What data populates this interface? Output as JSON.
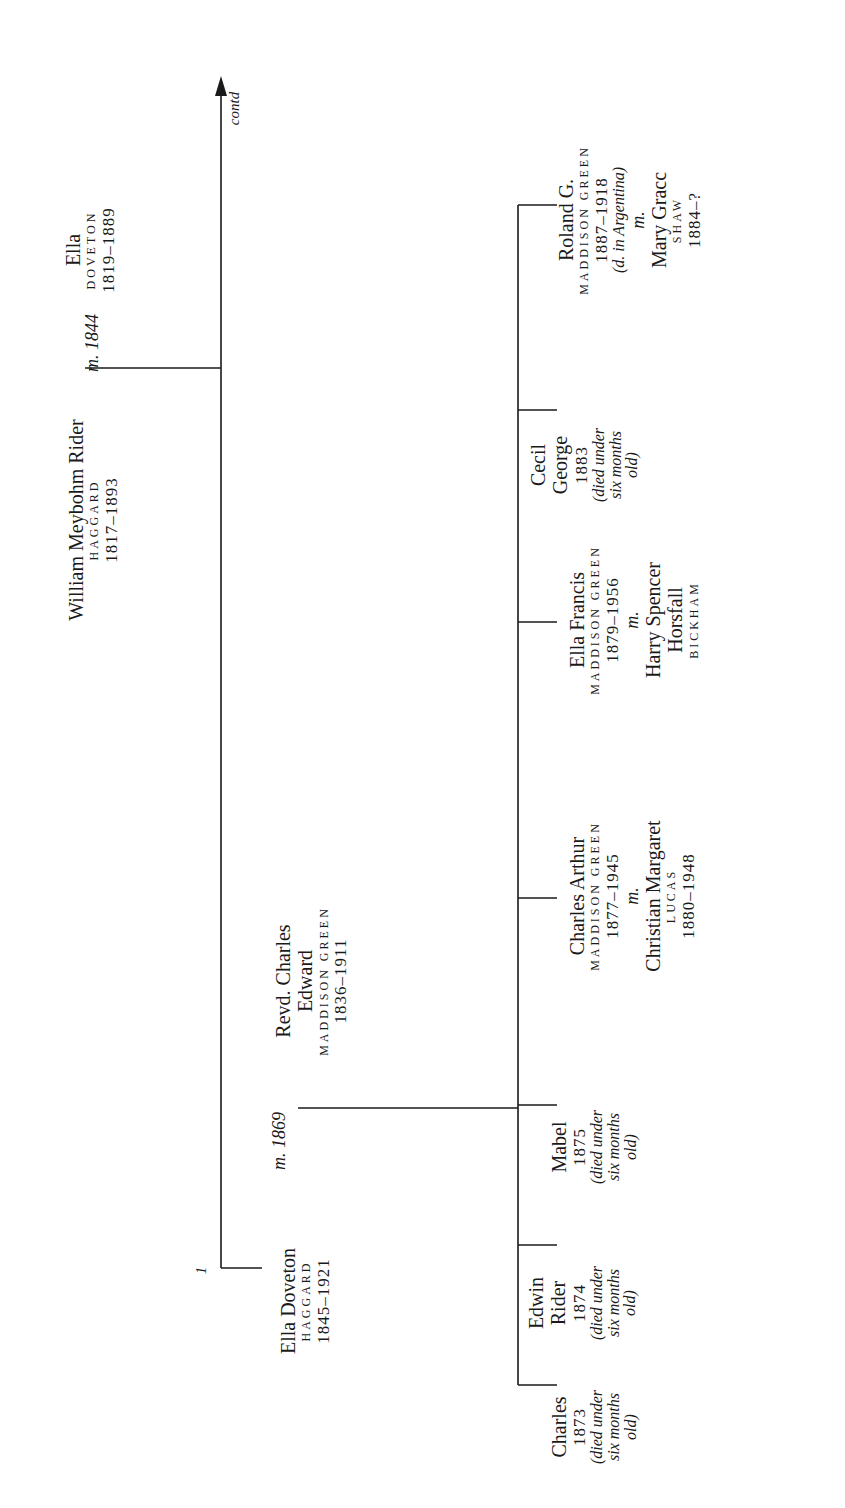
{
  "continuation_label": "contd",
  "marker_number": "1",
  "generation1": {
    "husband": {
      "name": "William Meybohm Rider",
      "surname": "HAGGARD",
      "years": "1817–1893"
    },
    "marriage": "m. 1844",
    "wife": {
      "name": "Ella",
      "surname": "DOVETON",
      "years": "1819–1889"
    }
  },
  "generation2": {
    "wife": {
      "name": "Ella Doveton",
      "surname": "HAGGARD",
      "years": "1845–1921"
    },
    "marriage": "m. 1869",
    "husband": {
      "name_line1": "Revd. Charles",
      "name_line2": "Edward",
      "surname": "MADDISON GREEN",
      "years": "1836–1911"
    }
  },
  "children": [
    {
      "name_lines": [
        "Charles"
      ],
      "years": "1873",
      "note_lines": [
        "(died under",
        "six months",
        "old)"
      ]
    },
    {
      "name_lines": [
        "Edwin",
        "Rider"
      ],
      "years": "1874",
      "note_lines": [
        "(died under",
        "six months",
        "old)"
      ]
    },
    {
      "name_lines": [
        "Mabel"
      ],
      "years": "1875",
      "note_lines": [
        "(died under",
        "six months",
        "old)"
      ]
    },
    {
      "name_lines": [
        "Charles Arthur"
      ],
      "surname": "MADDISON GREEN",
      "years": "1877–1945",
      "marriage": "m.",
      "spouse": {
        "name_lines": [
          "Christian Margaret"
        ],
        "surname": "LUCAS",
        "years": "1880–1948"
      }
    },
    {
      "name_lines": [
        "Ella Francis"
      ],
      "surname": "MADDISON GREEN",
      "years": "1879–1956",
      "marriage": "m.",
      "spouse": {
        "name_lines": [
          "Harry Spencer",
          "Horsfall"
        ],
        "surname": "BICKHAM"
      }
    },
    {
      "name_lines": [
        "Cecil",
        "George"
      ],
      "years": "1883",
      "note_lines": [
        "(died under",
        "six months",
        "old)"
      ]
    },
    {
      "name_lines": [
        "Roland G."
      ],
      "surname": "MADDISON GREEN",
      "years": "1887–1918",
      "note_lines": [
        "(d. in Argentina)"
      ],
      "marriage": "m.",
      "spouse": {
        "name_lines": [
          "Mary Gracc"
        ],
        "surname": "SHAW",
        "years": "1884–?"
      }
    }
  ],
  "colors": {
    "ink": "#1a1a1a",
    "background": "#ffffff"
  }
}
